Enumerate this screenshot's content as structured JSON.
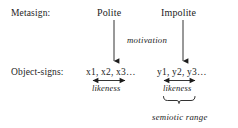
{
  "diagram": {
    "type": "semiotic-relation-diagram",
    "background_color": "#ffffff",
    "ink_color": "#1c1c1c",
    "rows": [
      {
        "id": "metasign",
        "label": "Metasign:"
      },
      {
        "id": "object-signs",
        "label": "Object-signs:"
      }
    ],
    "columns": [
      {
        "id": "polite",
        "head": "Polite",
        "object_signs": "x1, x2, x3…",
        "likeness_label": "likeness"
      },
      {
        "id": "impolite",
        "head": "Impolite",
        "object_signs": "y1, y2, y3…",
        "likeness_label": "likeness"
      }
    ],
    "annotations": {
      "motivation": "motivation",
      "semiotic_range": "semiotic range"
    }
  }
}
